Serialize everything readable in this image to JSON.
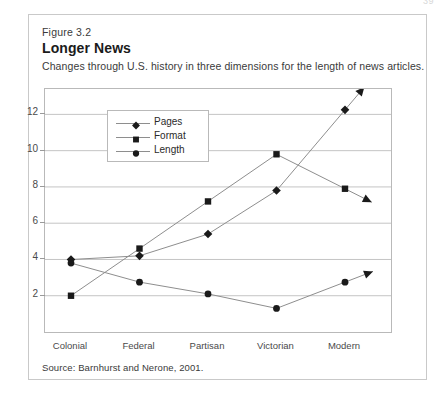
{
  "page_number": "39",
  "figure": {
    "label": "Figure 3.2",
    "title": "Longer News",
    "subtitle": "Changes through U.S. history in three dimensions for the length of news articles.",
    "source": "Source: Barnhurst and Nerone, 2001."
  },
  "colors": {
    "marker": "#1a1a1a",
    "line": "#8e8e8e",
    "grid": "#c4c4c4",
    "frame": "#b9b9b9",
    "box_border": "#c9c9c9",
    "text": "#231f20"
  },
  "chart_data": {
    "type": "line",
    "title": "Longer News",
    "xlabel": "",
    "ylabel": "",
    "categories": [
      "Colonial",
      "Federal",
      "Partisan",
      "Victorian",
      "Modern"
    ],
    "yticks": [
      2,
      4,
      6,
      8,
      10,
      12
    ],
    "ylim": [
      0,
      13.4
    ],
    "grid": true,
    "legend_position": "top-left-inside",
    "arrow_extension": true,
    "series": [
      {
        "name": "Pages",
        "marker": "diamond",
        "values": [
          4.0,
          4.2,
          5.4,
          7.8,
          12.25
        ]
      },
      {
        "name": "Format",
        "marker": "square",
        "values": [
          2.0,
          4.6,
          7.2,
          9.8,
          7.9
        ]
      },
      {
        "name": "Length",
        "marker": "circle",
        "values": [
          3.8,
          2.75,
          2.1,
          1.3,
          2.75
        ]
      }
    ]
  }
}
